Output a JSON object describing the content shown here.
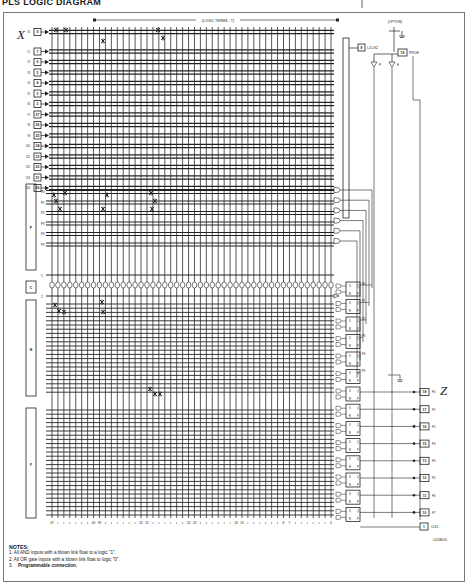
{
  "title": "PLS LOGIC DIAGRAM",
  "header": {
    "logic_terms_label": "(LOGIC TERMS - T)",
    "option_label": "(OPTION)"
  },
  "side_labels": {
    "x": "X",
    "z": "Z"
  },
  "inputs": [
    {
      "name": "I0",
      "pin": "9"
    },
    {
      "name": "I1",
      "pin": "7"
    },
    {
      "name": "I2",
      "pin": "6"
    },
    {
      "name": "I3",
      "pin": "5"
    },
    {
      "name": "I4",
      "pin": "4"
    },
    {
      "name": "I5",
      "pin": "3"
    },
    {
      "name": "I6",
      "pin": "2"
    },
    {
      "name": "I7",
      "pin": "27"
    },
    {
      "name": "I8",
      "pin": "26"
    },
    {
      "name": "I9",
      "pin": "25"
    },
    {
      "name": "I10",
      "pin": "24"
    },
    {
      "name": "I11",
      "pin": "23"
    },
    {
      "name": "I12",
      "pin": "22"
    },
    {
      "name": "I13",
      "pin": "21"
    },
    {
      "name": "I14",
      "pin": "20"
    }
  ],
  "state_rows": [
    "P0",
    "P1",
    "P2",
    "P3",
    "P4",
    "P5"
  ],
  "blocks": {
    "p": "P",
    "c": "C",
    "n": "N",
    "f": "F"
  },
  "complement_rows": [
    "C",
    "C"
  ],
  "flipflop_state_labels": [
    "P0",
    "P1",
    "P2",
    "P3",
    "P4",
    "P5"
  ],
  "ff_letters": {
    "s": "S",
    "q": "Q",
    "r": "R",
    "p": "P"
  },
  "outputs": [
    {
      "name": "F0",
      "pin": "18"
    },
    {
      "name": "F1",
      "pin": "17"
    },
    {
      "name": "F2",
      "pin": "16"
    },
    {
      "name": "F3",
      "pin": "15"
    },
    {
      "name": "F4",
      "pin": "13"
    },
    {
      "name": "F5",
      "pin": "12"
    },
    {
      "name": "F6",
      "pin": "11"
    },
    {
      "name": "F7",
      "pin": "10"
    }
  ],
  "clock_pins": {
    "clk1": {
      "pin": "1",
      "label": "CLK1"
    },
    "clk2": {
      "pin": "8",
      "label": "I₀/CLK2"
    },
    "pre_oe": {
      "pin": "19",
      "label": "PR/OE"
    }
  },
  "gate_labels": {
    "p": "P",
    "e": "E"
  },
  "term_axis": [
    "47",
    "40",
    "39",
    "32",
    "31",
    "24",
    "23",
    "16",
    "15",
    "8",
    "7",
    "0"
  ],
  "code": "LD02B105",
  "notes": {
    "heading": "NOTES:",
    "items": [
      "1.  All AND inputs with a blown link float to a logic \"1\".",
      "2.  All OR gate inputs with a blown link float to logic \"0\".",
      "3."
    ],
    "programmable": "Programmable connection."
  }
}
